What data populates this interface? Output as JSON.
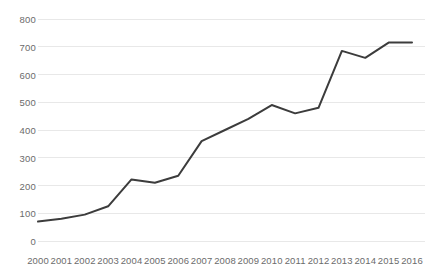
{
  "chart_data": {
    "type": "line",
    "title": "",
    "subtitle": "",
    "xlabel": "",
    "ylabel": "",
    "categories": [
      "2000",
      "2001",
      "2002",
      "2003",
      "2004",
      "2005",
      "2006",
      "2007",
      "2008",
      "2009",
      "2010",
      "2011",
      "2012",
      "2013",
      "2014",
      "2015",
      "2016"
    ],
    "values": [
      70,
      80,
      95,
      125,
      222,
      210,
      235,
      360,
      400,
      440,
      490,
      460,
      480,
      685,
      660,
      715,
      715
    ],
    "series": [
      {
        "name": "Series 1",
        "values": [
          70,
          80,
          95,
          125,
          222,
          210,
          235,
          360,
          400,
          440,
          490,
          460,
          480,
          685,
          660,
          715,
          715
        ]
      }
    ],
    "ylim": [
      0,
      800
    ],
    "yticks": [
      0,
      100,
      200,
      300,
      400,
      500,
      600,
      700,
      800
    ],
    "ytick_labels": [
      "0",
      "100",
      "200",
      "300",
      "400",
      "500",
      "600",
      "700",
      "800"
    ],
    "xtick_labels": [
      "2000",
      "2001",
      "2002",
      "2003",
      "2004",
      "2005",
      "2006",
      "2007",
      "2008",
      "2009",
      "2010",
      "2011",
      "2012",
      "2013",
      "2014",
      "2015",
      "2016"
    ],
    "grid": true,
    "grid_axis": "y",
    "legend": false,
    "legend_position": "none",
    "annotations": [],
    "colors": {
      "line": "#3c3c3c",
      "grid": "#e8e8e8",
      "tick_text": "#6b6b6b",
      "background": "#ffffff"
    },
    "line_width": 2
  }
}
